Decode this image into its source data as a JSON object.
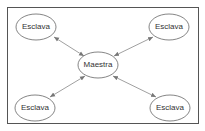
{
  "diagram": {
    "nodes": [
      {
        "id": "master",
        "label": "Maestra",
        "cx": 98,
        "cy": 65
      },
      {
        "id": "slave-tl",
        "label": "Esclava",
        "cx": 36,
        "cy": 27
      },
      {
        "id": "slave-tr",
        "label": "Esclava",
        "cx": 169,
        "cy": 27
      },
      {
        "id": "slave-bl",
        "label": "Esclava",
        "cx": 35,
        "cy": 108
      },
      {
        "id": "slave-br",
        "label": "Esclava",
        "cx": 170,
        "cy": 108
      }
    ],
    "edges": [
      {
        "from": "master",
        "to": "slave-tl",
        "direction": "bidirectional"
      },
      {
        "from": "master",
        "to": "slave-tr",
        "direction": "bidirectional"
      },
      {
        "from": "master",
        "to": "slave-bl",
        "direction": "bidirectional"
      },
      {
        "from": "master",
        "to": "slave-br",
        "direction": "bidirectional"
      }
    ]
  }
}
